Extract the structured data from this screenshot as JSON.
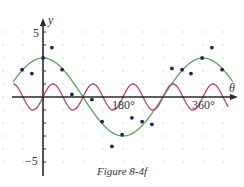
{
  "chart_data": {
    "type": "line",
    "title": "",
    "caption": "Figure 8-4f",
    "xlabel": "θ",
    "ylabel": "y",
    "x_ticks": [
      {
        "value": 180,
        "label": "180°"
      },
      {
        "value": 360,
        "label": "360°"
      }
    ],
    "y_ticks": [
      {
        "value": 5,
        "label": "5"
      },
      {
        "value": -5,
        "label": "−5"
      }
    ],
    "xlim": [
      -67,
      435
    ],
    "ylim": [
      -6,
      6
    ],
    "grid": "dotted",
    "series": [
      {
        "name": "y = 3 cos θ",
        "type": "line",
        "color": "#5aa55a",
        "formula": "3*cos(theta)"
      },
      {
        "name": "y = sin 4θ",
        "type": "line",
        "color": "#b2475f",
        "formula": "sin(4*theta)"
      },
      {
        "name": "data points",
        "type": "scatter",
        "color": "#1e2a4a",
        "points": [
          [
            -47,
            2.1
          ],
          [
            -25,
            1.8
          ],
          [
            0,
            3.0
          ],
          [
            20,
            3.8
          ],
          [
            43,
            2.1
          ],
          [
            65,
            0.2
          ],
          [
            110,
            -0.2
          ],
          [
            133,
            -1.9
          ],
          [
            155,
            -3.8
          ],
          [
            178,
            -2.9
          ],
          [
            200,
            -1.6
          ],
          [
            223,
            -1.9
          ],
          [
            245,
            -2.1
          ],
          [
            290,
            2.2
          ],
          [
            313,
            2.1
          ],
          [
            333,
            1.8
          ],
          [
            358,
            3.0
          ],
          [
            380,
            3.8
          ],
          [
            403,
            2.1
          ]
        ]
      }
    ]
  }
}
